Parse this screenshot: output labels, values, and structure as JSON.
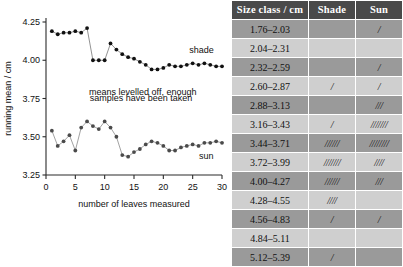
{
  "chart_data": {
    "type": "line",
    "title": "",
    "xlabel": "number of leaves measured",
    "ylabel": "running mean / cm",
    "xlim": [
      0,
      30
    ],
    "ylim": [
      3.25,
      4.25
    ],
    "xticks": [
      0,
      5,
      10,
      15,
      20,
      25,
      30
    ],
    "yticks": [
      "3.25",
      "3.50",
      "3.75",
      "4.00",
      "4.25"
    ],
    "grid": false,
    "legend": "inline-labels",
    "annotation": "means levelled off, enough samples have been taken",
    "annotation_line1": "means levelled off, enough",
    "annotation_line2": "samples have been taken",
    "x": [
      1,
      2,
      3,
      4,
      5,
      6,
      7,
      8,
      9,
      10,
      11,
      12,
      13,
      14,
      15,
      16,
      17,
      18,
      19,
      20,
      21,
      22,
      23,
      24,
      25,
      26,
      27,
      28,
      29,
      30
    ],
    "series": [
      {
        "name": "shade",
        "values": [
          4.19,
          4.17,
          4.18,
          4.18,
          4.19,
          4.18,
          4.21,
          4.0,
          4.0,
          4.0,
          4.11,
          4.07,
          4.04,
          4.02,
          4.01,
          3.99,
          3.97,
          3.94,
          3.94,
          3.95,
          3.97,
          3.96,
          3.96,
          3.97,
          3.98,
          3.97,
          3.98,
          3.97,
          3.96,
          3.96
        ]
      },
      {
        "name": "sun",
        "values": [
          3.54,
          3.44,
          3.47,
          3.51,
          3.41,
          3.56,
          3.6,
          3.57,
          3.55,
          3.6,
          3.56,
          3.5,
          3.38,
          3.37,
          3.4,
          3.42,
          3.45,
          3.47,
          3.46,
          3.44,
          3.41,
          3.41,
          3.43,
          3.44,
          3.45,
          3.44,
          3.46,
          3.46,
          3.47,
          3.46
        ]
      }
    ]
  },
  "table": {
    "columns": [
      "Size class / cm",
      "Shade",
      "Sun"
    ],
    "rows": [
      {
        "size_class": "1.76–2.03",
        "shade": "",
        "sun": "/"
      },
      {
        "size_class": "2.04–2.31",
        "shade": "",
        "sun": ""
      },
      {
        "size_class": "2.32–2.59",
        "shade": "",
        "sun": "/"
      },
      {
        "size_class": "2.60–2.87",
        "shade": "/",
        "sun": "/"
      },
      {
        "size_class": "2.88–3.13",
        "shade": "",
        "sun": "///"
      },
      {
        "size_class": "3.16–3.43",
        "shade": "/",
        "sun": "///////"
      },
      {
        "size_class": "3.44–3.71",
        "shade": "//////",
        "sun": "////////"
      },
      {
        "size_class": "3.72–3.99",
        "shade": "///////",
        "sun": "////"
      },
      {
        "size_class": "4.00–4.27",
        "shade": "//////",
        "sun": "///"
      },
      {
        "size_class": "4.28–4.55",
        "shade": "////",
        "sun": ""
      },
      {
        "size_class": "4.56–4.83",
        "shade": "/",
        "sun": "/"
      },
      {
        "size_class": "4.84–5.11",
        "shade": "",
        "sun": ""
      },
      {
        "size_class": "5.12–5.39",
        "shade": "/",
        "sun": ""
      }
    ]
  },
  "colors": {
    "header_bg": "#4a4a4a",
    "band_dark": "#9a9a9a",
    "band_light": "#cfcfcf",
    "point": "#111111",
    "line": "#8a8a8a"
  }
}
